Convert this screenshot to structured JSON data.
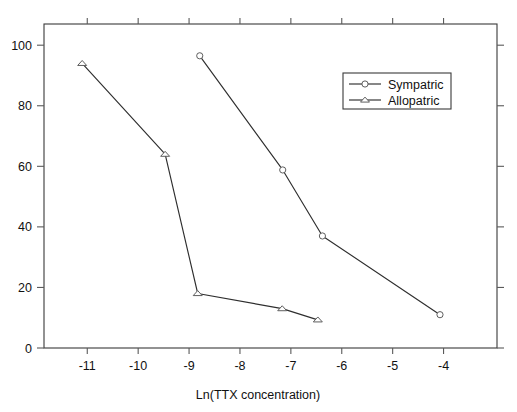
{
  "chart_data": {
    "type": "line",
    "title": "",
    "subtitle": "",
    "xlabel": "Ln(TTX concentration)",
    "ylabel": "",
    "xlim": [
      -11.85,
      -2.95
    ],
    "ylim": [
      0,
      107
    ],
    "xticks": [
      -11,
      -10,
      -9,
      -8,
      -7,
      -6,
      -5,
      -4
    ],
    "xticklabels": [
      "-11",
      "-10",
      "-9",
      "-8",
      "-7",
      "-6",
      "-5",
      "-4"
    ],
    "yticks": [
      0,
      20,
      40,
      60,
      80,
      100
    ],
    "yticklabels": [
      "0",
      "20",
      "40",
      "60",
      "80",
      "100"
    ],
    "grid": false,
    "legend_position": "upper right",
    "box_frame": true,
    "series": [
      {
        "name": "Sympatric",
        "marker": "circle",
        "color": "#2e2e2e",
        "x": [
          -8.79,
          -7.16,
          -6.38,
          -4.07
        ],
        "y": [
          96.5,
          58.8,
          37.0,
          11.0
        ]
      },
      {
        "name": "Allopatric",
        "marker": "triangle",
        "color": "#2e2e2e",
        "x": [
          -11.1,
          -9.47,
          -8.83,
          -7.17,
          -6.47
        ],
        "y": [
          94.0,
          64.0,
          18.0,
          13.0,
          9.3
        ]
      }
    ]
  },
  "legend": {
    "entries": [
      {
        "label": "Sympatric",
        "marker": "circle"
      },
      {
        "label": "Allopatric",
        "marker": "triangle"
      }
    ]
  },
  "axes": {
    "x_axis_title": "Ln(TTX concentration)"
  }
}
